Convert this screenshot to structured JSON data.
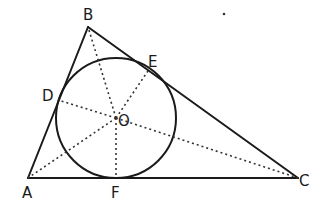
{
  "figure": {
    "type": "geometry",
    "colors": {
      "ink": "#1a1a1a",
      "background": "#ffffff"
    },
    "vertices": {
      "A": {
        "label": "A",
        "x": 28,
        "y": 178
      },
      "B": {
        "label": "B",
        "x": 88,
        "y": 27
      },
      "C": {
        "label": "C",
        "x": 298,
        "y": 178
      }
    },
    "incircle": {
      "center_label": "O",
      "cx": 116,
      "cy": 118,
      "r": 60
    },
    "tangent_points": {
      "D": {
        "label": "D",
        "side": "AB"
      },
      "E": {
        "label": "E",
        "side": "BC"
      },
      "F": {
        "label": "F",
        "side": "AC"
      }
    },
    "labels": {
      "A": "A",
      "B": "B",
      "C": "C",
      "D": "D",
      "E": "E",
      "F": "F",
      "O": "O"
    },
    "dotted_segments": [
      "OA",
      "OB",
      "OC",
      "OD",
      "OE",
      "OF"
    ]
  }
}
